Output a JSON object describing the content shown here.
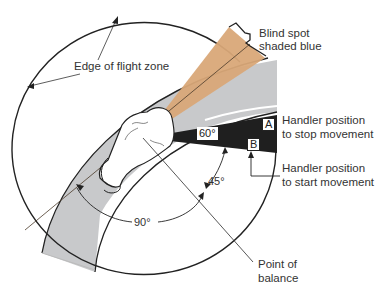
{
  "diagram": {
    "type": "flight-zone-diagram",
    "labels": {
      "edge_of_flight_zone": "Edge of flight zone",
      "blind_spot_line1": "Blind spot",
      "blind_spot_line2": "shaded blue",
      "handler_stop_line1": "Handler position",
      "handler_stop_line2": "to stop movement",
      "handler_start_line1": "Handler position",
      "handler_start_line2": "to start movement",
      "point_of_balance_line1": "Point of",
      "point_of_balance_line2": "balance"
    },
    "angles": {
      "wedge": "60°",
      "balance": "45°",
      "side": "90°"
    },
    "markers": {
      "a": "A",
      "b": "B"
    },
    "colors": {
      "blind_spot": "#d9a878",
      "chute": "#c8c9cb",
      "handler_zone": "#1f1f1f",
      "line": "#222222"
    }
  }
}
